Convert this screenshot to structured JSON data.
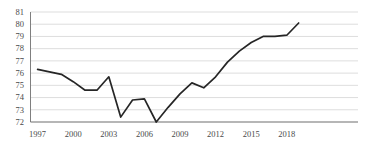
{
  "chart_data": {
    "type": "line",
    "title": "",
    "xlabel": "",
    "ylabel": "",
    "xlim": [
      1996.4,
      2024.0
    ],
    "ylim": [
      72,
      81
    ],
    "grid": true,
    "grid_axis": "y",
    "legend": false,
    "legend_position": "none",
    "line_color": "#262626",
    "grid_color": "#d4d4d4",
    "axis_color": "#7f7f7f",
    "ytick_labels": [
      "81",
      "80",
      "79",
      "78",
      "77",
      "76",
      "75",
      "74",
      "73",
      "72"
    ],
    "ytick_values": [
      81,
      80,
      79,
      78,
      77,
      76,
      75,
      74,
      73,
      72
    ],
    "xtick_labels": [
      "1997",
      "2000",
      "2003",
      "2006",
      "2009",
      "2012",
      "2015",
      "2018"
    ],
    "xtick_values": [
      1997,
      2000,
      2003,
      2006,
      2009,
      2012,
      2015,
      2018
    ],
    "x": [
      1997,
      1998,
      1999,
      2000,
      2001,
      2002,
      2003,
      2004,
      2005,
      2006,
      2007,
      2008,
      2009,
      2010,
      2011,
      2012,
      2013,
      2014,
      2015,
      2016,
      2017,
      2018,
      2019
    ],
    "values": [
      76.3,
      76.1,
      75.9,
      75.3,
      74.6,
      74.6,
      75.7,
      72.4,
      73.8,
      73.9,
      72.0,
      73.2,
      74.3,
      75.2,
      74.8,
      75.7,
      76.9,
      77.8,
      78.5,
      79.0,
      79.0,
      79.1,
      80.1
    ],
    "series": [
      {
        "name": "series-1",
        "values": [
          76.3,
          76.1,
          75.9,
          75.3,
          74.6,
          74.6,
          75.7,
          72.4,
          73.8,
          73.9,
          72.0,
          73.2,
          74.3,
          75.2,
          74.8,
          75.7,
          76.9,
          77.8,
          78.5,
          79.0,
          79.0,
          79.1,
          80.1
        ]
      }
    ]
  }
}
